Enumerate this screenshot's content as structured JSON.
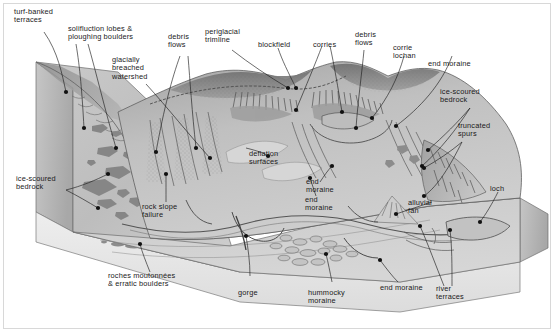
{
  "figure": {
    "type": "annotated-block-diagram",
    "width": 556,
    "height": 334,
    "background_color": "#ffffff",
    "border_color": "#d8d8d8",
    "palette": {
      "sky": "#ffffff",
      "block_front_face": "#e3e3e3",
      "block_side_face": "#b9b9b9",
      "valley_floor": "#d3d3d3",
      "hillslope_light": "#cfcfcf",
      "hillslope_mid": "#b5b5b5",
      "hillslope_dark": "#9a9a9a",
      "ridge_shadow": "#8a8a8a",
      "rock_outcrop": "#7d7d7d",
      "water": "#c2c2c2",
      "line": "#3a3a3a",
      "text": "#1a1a1a"
    }
  },
  "labels": [
    {
      "id": "turf-banked-terraces",
      "text": "turf-banked\nterraces"
    },
    {
      "id": "solifluction-lobes",
      "text": "solifluction lobes &\nploughing boulders"
    },
    {
      "id": "glacially-breached-watershed",
      "text": "glacially\nbreached\nwatershed"
    },
    {
      "id": "debris-flows-left",
      "text": "debris\nflows"
    },
    {
      "id": "periglacial-trimline",
      "text": "periglacial\ntrimline"
    },
    {
      "id": "blockfield",
      "text": "blockfield"
    },
    {
      "id": "corries",
      "text": "corries"
    },
    {
      "id": "debris-flows-right",
      "text": "debris\nflows"
    },
    {
      "id": "corrie-lochan",
      "text": "corrie\nlochan"
    },
    {
      "id": "end-moraine-upper-right",
      "text": "end moraine"
    },
    {
      "id": "ice-scoured-bedrock-right",
      "text": "ice-scoured\nbedrock"
    },
    {
      "id": "truncated-spurs",
      "text": "truncated\nspurs"
    },
    {
      "id": "deflation-surfaces",
      "text": "deflation\nsurfaces"
    },
    {
      "id": "ice-scoured-bedrock-left",
      "text": "ice-scoured\nbedrock"
    },
    {
      "id": "rock-slope-failure",
      "text": "rock slope\nfailure"
    },
    {
      "id": "end-moraine-centre",
      "text": "end\nmoraine"
    },
    {
      "id": "alluvial-fan",
      "text": "alluvial\nfan"
    },
    {
      "id": "loch",
      "text": "loch"
    },
    {
      "id": "end-moraine-mid-right",
      "text": "end\nmoraine"
    },
    {
      "id": "river-terraces",
      "text": "river\nterraces"
    },
    {
      "id": "roches-moutonnees",
      "text": "roches moutonnées\n& erratic boulders"
    },
    {
      "id": "gorge",
      "text": "gorge"
    },
    {
      "id": "hummocky-moraine",
      "text": "hummocky\nmoraine"
    },
    {
      "id": "end-moraine-bottom",
      "text": "end moraine"
    }
  ]
}
